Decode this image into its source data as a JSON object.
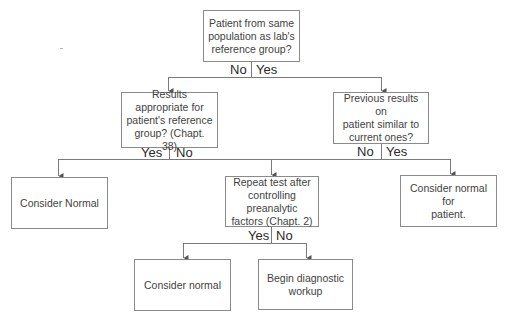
{
  "diagram": {
    "type": "decision-flowchart",
    "nodes": {
      "q_population": "Patient from same\npopulation as lab's\nreference group?",
      "q_appropriate": "Results appropriate for\npatient's reference\ngroup? (Chapt. 38)",
      "q_previous": "Previous results on\npatient similar to\ncurrent ones?",
      "a_consider_normal_1": "Consider Normal",
      "q_repeat": "Repeat test after\ncontrolling  preanalytic\nfactors (Chapt. 2)",
      "a_consider_normal_patient": "Consider normal for\npatient.",
      "a_consider_normal_2": "Consider normal",
      "a_begin_workup": "Begin diagnostic\nworkup"
    },
    "branch_labels": {
      "q_population": {
        "no": "No",
        "yes": "Yes"
      },
      "q_appropriate": {
        "yes": "Yes",
        "no": "No"
      },
      "q_previous": {
        "no": "No",
        "yes": "Yes"
      },
      "q_repeat": {
        "yes": "Yes",
        "no": "No"
      }
    },
    "edges": [
      {
        "from": "q_population",
        "to": "q_appropriate",
        "label": "No"
      },
      {
        "from": "q_population",
        "to": "q_previous",
        "label": "Yes"
      },
      {
        "from": "q_appropriate",
        "to": "a_consider_normal_1",
        "label": "Yes"
      },
      {
        "from": "q_appropriate",
        "to": "q_repeat",
        "label": "No"
      },
      {
        "from": "q_previous",
        "to": "q_repeat",
        "label": "No"
      },
      {
        "from": "q_previous",
        "to": "a_consider_normal_patient",
        "label": "Yes"
      },
      {
        "from": "q_repeat",
        "to": "a_consider_normal_2",
        "label": "Yes"
      },
      {
        "from": "q_repeat",
        "to": "a_begin_workup",
        "label": "No"
      }
    ],
    "colors": {
      "line": "#7a7a7a",
      "box_border": "#8a8a8a",
      "text": "#3f3f3f"
    }
  }
}
